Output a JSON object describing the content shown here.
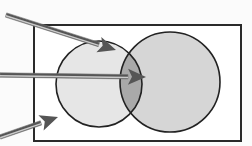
{
  "diagram": {
    "type": "venn",
    "universe": {
      "x": 34,
      "y": 25,
      "w": 207,
      "h": 116,
      "stroke": "#2a2a2a",
      "fill": "#ffffff"
    },
    "sets": [
      {
        "name": "set-a",
        "cx": 99,
        "cy": 84,
        "r": 43,
        "fill": "#e6e6e6"
      },
      {
        "name": "set-b",
        "cx": 170,
        "cy": 82,
        "r": 50,
        "fill": "#d6d6d6"
      }
    ],
    "intersection_fill": "#a9a9a9",
    "arrows": [
      {
        "name": "arrow-to-set-a",
        "x1": 6,
        "y1": 15,
        "x2": 116,
        "y2": 50
      },
      {
        "name": "arrow-to-intersection",
        "x1": 0,
        "y1": 75,
        "x2": 146,
        "y2": 77
      },
      {
        "name": "arrow-to-universe",
        "x1": 0,
        "y1": 137,
        "x2": 58,
        "y2": 117
      }
    ],
    "arrow_color": "#555555"
  }
}
